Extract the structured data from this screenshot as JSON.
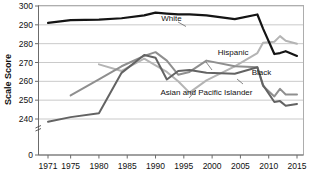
{
  "chart_data": {
    "type": "line",
    "title": "",
    "xlabel": "",
    "ylabel": "Scale Score",
    "ylim": [
      236,
      300
    ],
    "xlim": [
      1971,
      2015
    ],
    "grid": true,
    "legend_position": "inline-annotations",
    "y_ticks": [
      "300",
      "290",
      "280",
      "270",
      "260",
      "250",
      "240",
      "0"
    ],
    "y_tick_values": [
      300,
      290,
      280,
      270,
      260,
      250,
      240,
      0
    ],
    "x_ticks": [
      "1971",
      "1975",
      "1980",
      "1985",
      "1990",
      "1995",
      "2000",
      "2005",
      "2010",
      "2015"
    ],
    "x_tick_values": [
      1971,
      1975,
      1980,
      1985,
      1990,
      1995,
      2000,
      2005,
      2010,
      2015
    ],
    "axis_break": "y-axis broken between 0 and 240",
    "series": [
      {
        "name": "White",
        "color": "#141414",
        "x": [
          1971,
          1975,
          1980,
          1984,
          1988,
          1990,
          1992,
          1994,
          1996,
          1999,
          2004,
          2008,
          2009,
          2011,
          2012,
          2013,
          2015
        ],
        "values": [
          291.0,
          292.5,
          292.8,
          293.5,
          295.0,
          296.5,
          296.0,
          295.5,
          295.5,
          295.0,
          293.0,
          295.5,
          288.0,
          274.5,
          275.0,
          276.0,
          273.5
        ]
      },
      {
        "name": "Black",
        "color": "#636363",
        "x": [
          1971,
          1975,
          1980,
          1984,
          1988,
          1990,
          1992,
          1994,
          1996,
          1999,
          2004,
          2008,
          2009,
          2011,
          2012,
          2013,
          2015
        ],
        "values": [
          238.5,
          241.0,
          243.0,
          264.5,
          274.0,
          272.5,
          261.0,
          265.5,
          266.0,
          264.5,
          264.0,
          267.5,
          258.0,
          249.0,
          249.5,
          247.0,
          248.0
        ]
      },
      {
        "name": "Hispanic",
        "color": "#8f8f8f",
        "x": [
          1975,
          1980,
          1984,
          1988,
          1990,
          1992,
          1994,
          1996,
          1999,
          2004,
          2008,
          2009,
          2011,
          2012,
          2013,
          2015
        ],
        "values": [
          252.5,
          261.0,
          268.0,
          273.5,
          275.5,
          271.0,
          263.5,
          265.0,
          271.0,
          268.0,
          267.5,
          257.5,
          252.0,
          256.0,
          253.0,
          253.0
        ]
      },
      {
        "name": "Asian and Pacific Islander",
        "color": "#b4b4b4",
        "x": [
          1980,
          1984,
          1988,
          1990,
          1992,
          1994,
          1996,
          1999,
          2004,
          2008,
          2009,
          2011,
          2012,
          2013,
          2015
        ],
        "values": [
          269.0,
          265.5,
          272.0,
          268.5,
          265.0,
          260.0,
          254.0,
          260.5,
          268.0,
          275.0,
          280.5,
          281.0,
          284.0,
          281.5,
          280.0
        ]
      }
    ],
    "annotations": [
      {
        "label": "White",
        "x": 1991,
        "y": 292.0
      },
      {
        "label": "Hispanic",
        "x": 2001,
        "y": 274.0
      },
      {
        "label": "Black",
        "x": 2007,
        "y": 263.5
      },
      {
        "label": "Asian and Pacific Islander",
        "x": 1999,
        "y": 252.5
      }
    ]
  }
}
